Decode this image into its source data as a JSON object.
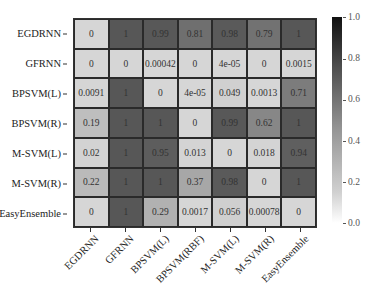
{
  "chart_data": {
    "type": "heatmap",
    "title": "",
    "xlabel": "",
    "ylabel": "",
    "rows": [
      "EGDRNN",
      "GFRNN",
      "BPSVM(L)",
      "BPSVM(R)",
      "M-SVM(L)",
      "M-SVM(R)",
      "EasyEnsemble"
    ],
    "columns": [
      "EGDRNN",
      "GFRNN",
      "BPSVM(L)",
      "BPSVM(RBF)",
      "M-SVM(L)",
      "M-SVM(R)",
      "EasyEnsemble"
    ],
    "values": [
      [
        0,
        1,
        0.99,
        0.81,
        0.98,
        0.79,
        1
      ],
      [
        0,
        0,
        0.00042,
        0,
        4e-05,
        0,
        0.0015
      ],
      [
        0.0091,
        1,
        0,
        4e-05,
        0.049,
        0.0013,
        0.71
      ],
      [
        0.19,
        1,
        1,
        0,
        0.99,
        0.62,
        1
      ],
      [
        0.02,
        1,
        0.95,
        0.013,
        0,
        0.018,
        0.94
      ],
      [
        0.22,
        1,
        1,
        0.37,
        0.98,
        0,
        1
      ],
      [
        0,
        1,
        0.29,
        0.0017,
        0.056,
        0.00078,
        0
      ]
    ],
    "annotations": [
      [
        "0",
        "1",
        "0.99",
        "0.81",
        "0.98",
        "0.79",
        "1"
      ],
      [
        "0",
        "0",
        "0.00042",
        "0",
        "4e-05",
        "0",
        "0.0015"
      ],
      [
        "0.0091",
        "1",
        "0",
        "4e-05",
        "0.049",
        "0.0013",
        "0.71"
      ],
      [
        "0.19",
        "1",
        "1",
        "0",
        "0.99",
        "0.62",
        "1"
      ],
      [
        "0.02",
        "1",
        "0.95",
        "0.013",
        "0",
        "0.018",
        "0.94"
      ],
      [
        "0.22",
        "1",
        "1",
        "0.37",
        "0.98",
        "0",
        "1"
      ],
      [
        "0",
        "1",
        "0.29",
        "0.0017",
        "0.056",
        "0.00078",
        "0"
      ]
    ],
    "colorbar": {
      "range": [
        0.0,
        1.0
      ],
      "ticks": [
        "0.0",
        "0.2",
        "0.4",
        "0.6",
        "0.8",
        "1.0"
      ],
      "colormap": "Greys"
    },
    "colors": {
      "low": "#d6d6d6",
      "high": "#575757"
    },
    "grid": true,
    "legend_position": "right"
  }
}
